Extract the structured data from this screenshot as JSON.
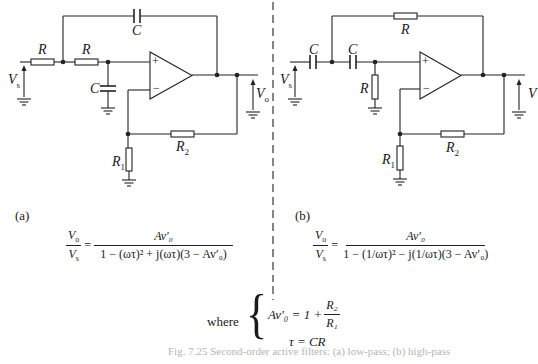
{
  "figure": {
    "panel_a": {
      "tag": "(a)",
      "labels": {
        "r_in_1": "R",
        "r_in_2": "R",
        "c_feedback": "C",
        "c_shunt": "C",
        "vs": "V",
        "vs_sub": "s",
        "vo": "V",
        "vo_sub": "o",
        "r1": "R",
        "r1_sub": "1",
        "r2": "R",
        "r2_sub": "2",
        "plus": "+",
        "minus": "−"
      },
      "equation": {
        "lhs_num": "V",
        "lhs_num_sub": "o",
        "lhs_den": "V",
        "lhs_den_sub": "s",
        "equals": "=",
        "rhs_num": "Av′₀",
        "rhs_den": "1 − (ωτ)² + j(ωτ)(3 − Av′₀)"
      }
    },
    "panel_b": {
      "tag": "(b)",
      "labels": {
        "c_in_1": "C",
        "c_in_2": "C",
        "r_feedback": "R",
        "r_shunt": "R",
        "vs": "V",
        "vs_sub": "s",
        "vo": "V",
        "r1": "R",
        "r1_sub": "1",
        "r2": "R",
        "r2_sub": "2",
        "plus": "+",
        "minus": "−"
      },
      "equation": {
        "lhs_num": "V",
        "lhs_num_sub": "o",
        "lhs_den": "V",
        "lhs_den_sub": "s",
        "equals": "=",
        "rhs_num": "Av′₀",
        "rhs_den": "1 − (1/ωτ)² − j(1/ωτ)(3 − Av′₀)"
      }
    },
    "where": {
      "word": "where",
      "line1_lhs": "Av′₀ = 1 + ",
      "line1_frac_num": "R₂",
      "line1_frac_den": "R₁",
      "line2": "τ = CR"
    },
    "caption": "Fig. 7.25  Second-order active filters: (a) low-pass; (b) high-pass"
  }
}
